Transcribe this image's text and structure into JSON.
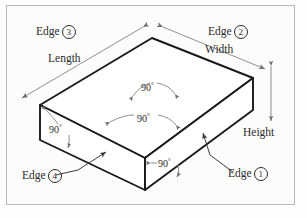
{
  "figure": {
    "background_color": "#fdfdfc",
    "frame_color": "#b9b9b9",
    "solid_edge_color": "#1a1a1a",
    "hidden_edge_color": "#9a9a9a",
    "annotation_color": "#8a8a8a",
    "text_color": "#2b2b2b"
  },
  "shape": {
    "type": "cuboid",
    "projection": "isometric",
    "vertices": {
      "top_back": [
        152,
        38
      ],
      "top_left": [
        40,
        105
      ],
      "top_right": [
        253,
        78
      ],
      "top_front": [
        145,
        158
      ],
      "bottom_left": [
        40,
        140
      ],
      "bottom_right": [
        253,
        110
      ],
      "bottom_front": [
        145,
        190
      ]
    }
  },
  "dimensions": [
    {
      "id": "length",
      "label": "Length",
      "edge": "top-left-upper",
      "arrow": "double"
    },
    {
      "id": "width",
      "label": "Width",
      "edge": "top-right-upper",
      "arrow": "double"
    },
    {
      "id": "height",
      "label": "Height",
      "edge": "right-vertical",
      "arrow": "double"
    }
  ],
  "angles": [
    {
      "id": "angle-top-center",
      "value": "90",
      "unit": "°",
      "location": "top-face-center-hidden"
    },
    {
      "id": "angle-front-top",
      "value": "90",
      "unit": "°",
      "location": "top-face-front-corner"
    },
    {
      "id": "angle-left",
      "value": "90",
      "unit": "°",
      "location": "left-face-corner"
    },
    {
      "id": "angle-front-bottom",
      "value": "90",
      "unit": "°",
      "location": "front-vertical-corner"
    }
  ],
  "edge_callouts": [
    {
      "id": "edge-1",
      "text": "Edge",
      "number": "1",
      "position": "bottom-right",
      "has_leader": true
    },
    {
      "id": "edge-2",
      "text": "Edge",
      "number": "2",
      "position": "top-right",
      "has_leader": false
    },
    {
      "id": "edge-3",
      "text": "Edge",
      "number": "3",
      "position": "top-left",
      "has_leader": false
    },
    {
      "id": "edge-4",
      "text": "Edge",
      "number": "4",
      "position": "bottom-left",
      "has_leader": true
    }
  ]
}
